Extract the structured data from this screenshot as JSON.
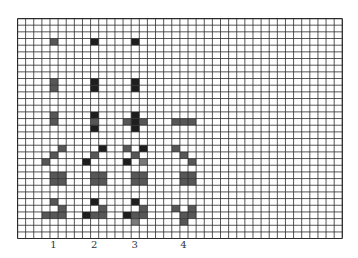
{
  "grid": {
    "columns": 40,
    "rows": 33,
    "shades": {
      "d": "#1e1e1e",
      "g": "#575757",
      "l": "#7a7a7a"
    },
    "line_color": "#2b2b2b",
    "cells": [
      [
        4,
        3,
        "g"
      ],
      [
        4,
        9,
        "g"
      ],
      [
        4,
        10,
        "g"
      ],
      [
        4,
        14,
        "g"
      ],
      [
        4,
        15,
        "g"
      ],
      [
        5,
        19,
        "g"
      ],
      [
        4,
        20,
        "g"
      ],
      [
        3,
        21,
        "g"
      ],
      [
        4,
        23,
        "g"
      ],
      [
        5,
        23,
        "g"
      ],
      [
        4,
        24,
        "g"
      ],
      [
        5,
        24,
        "g"
      ],
      [
        4,
        27,
        "g"
      ],
      [
        5,
        28,
        "g"
      ],
      [
        3,
        29,
        "g"
      ],
      [
        4,
        29,
        "g"
      ],
      [
        5,
        29,
        "g"
      ],
      [
        9,
        3,
        "d"
      ],
      [
        9,
        9,
        "d"
      ],
      [
        9,
        10,
        "d"
      ],
      [
        9,
        14,
        "d"
      ],
      [
        9,
        15,
        "g"
      ],
      [
        9,
        16,
        "d"
      ],
      [
        10,
        19,
        "d"
      ],
      [
        9,
        20,
        "g"
      ],
      [
        8,
        21,
        "d"
      ],
      [
        9,
        23,
        "g"
      ],
      [
        10,
        23,
        "g"
      ],
      [
        9,
        24,
        "g"
      ],
      [
        10,
        24,
        "g"
      ],
      [
        9,
        27,
        "d"
      ],
      [
        10,
        28,
        "g"
      ],
      [
        8,
        29,
        "d"
      ],
      [
        9,
        29,
        "g"
      ],
      [
        10,
        29,
        "g"
      ],
      [
        14,
        3,
        "d"
      ],
      [
        14,
        9,
        "d"
      ],
      [
        14,
        10,
        "d"
      ],
      [
        14,
        14,
        "d"
      ],
      [
        13,
        15,
        "g"
      ],
      [
        14,
        15,
        "d"
      ],
      [
        15,
        15,
        "g"
      ],
      [
        14,
        16,
        "d"
      ],
      [
        13,
        19,
        "g"
      ],
      [
        15,
        19,
        "d"
      ],
      [
        14,
        20,
        "g"
      ],
      [
        13,
        21,
        "d"
      ],
      [
        15,
        21,
        "l"
      ],
      [
        14,
        23,
        "g"
      ],
      [
        15,
        23,
        "g"
      ],
      [
        14,
        24,
        "g"
      ],
      [
        15,
        24,
        "g"
      ],
      [
        14,
        27,
        "d"
      ],
      [
        15,
        28,
        "g"
      ],
      [
        13,
        29,
        "d"
      ],
      [
        14,
        29,
        "g"
      ],
      [
        15,
        29,
        "g"
      ],
      [
        14,
        30,
        "l"
      ],
      [
        19,
        15,
        "g"
      ],
      [
        20,
        15,
        "g"
      ],
      [
        21,
        15,
        "g"
      ],
      [
        19,
        19,
        "g"
      ],
      [
        20,
        20,
        "g"
      ],
      [
        21,
        21,
        "g"
      ],
      [
        20,
        23,
        "g"
      ],
      [
        21,
        23,
        "g"
      ],
      [
        20,
        24,
        "g"
      ],
      [
        21,
        24,
        "g"
      ],
      [
        19,
        28,
        "g"
      ],
      [
        21,
        28,
        "g"
      ],
      [
        20,
        29,
        "g"
      ],
      [
        21,
        29,
        "g"
      ],
      [
        20,
        30,
        "g"
      ]
    ]
  },
  "lanes": [
    {
      "label": "1",
      "column": 4
    },
    {
      "label": "2",
      "column": 9
    },
    {
      "label": "3",
      "column": 14
    },
    {
      "label": "4",
      "column": 20
    }
  ]
}
